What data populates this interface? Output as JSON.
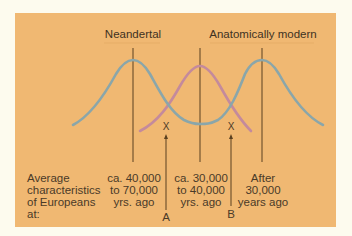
{
  "diagram": {
    "headers": {
      "neandertal": "Neandertal",
      "modern": "Anatomically modern"
    },
    "row_label": [
      "Average",
      "characteristics",
      "of Europeans",
      "at:"
    ],
    "columns": [
      {
        "lines": [
          "ca. 40,000",
          "to 70,000",
          "yrs. ago"
        ]
      },
      {
        "lines": [
          "ca. 30,000",
          "to 40,000",
          "yrs. ago"
        ]
      },
      {
        "lines": [
          "After",
          "30,000",
          "years ago"
        ]
      }
    ],
    "markers": {
      "cross": "X",
      "a_label": "A",
      "b_label": "B"
    },
    "colors": {
      "background": "#fdfbee",
      "panel": "#f0b872",
      "blue_curve": "#8aa6aa",
      "pink_curve": "#c48a9c",
      "lines": "#5a4020",
      "text": "#4a3a28"
    }
  }
}
